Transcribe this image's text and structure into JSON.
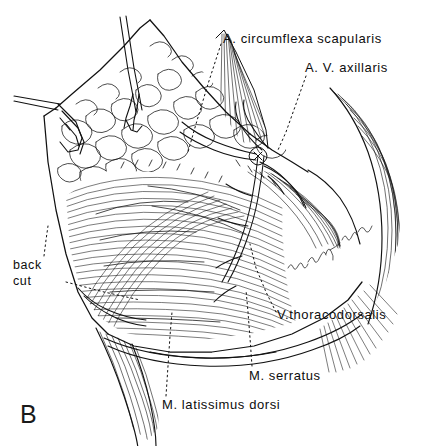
{
  "figure": {
    "panel_letter": "B",
    "background_color": "#ffffff",
    "ink_color": "#111111"
  },
  "labels": {
    "circumflexa_scapularis": "A. circumflexa scapularis",
    "axillaris": "A. V. axillaris",
    "thoracodorsalis": "V.thoracodorsalis",
    "serratus": "M. serratus",
    "latissimus_dorsi": "M. latissimus dorsi",
    "back_cut_line1": "back",
    "back_cut_line2": "cut"
  }
}
